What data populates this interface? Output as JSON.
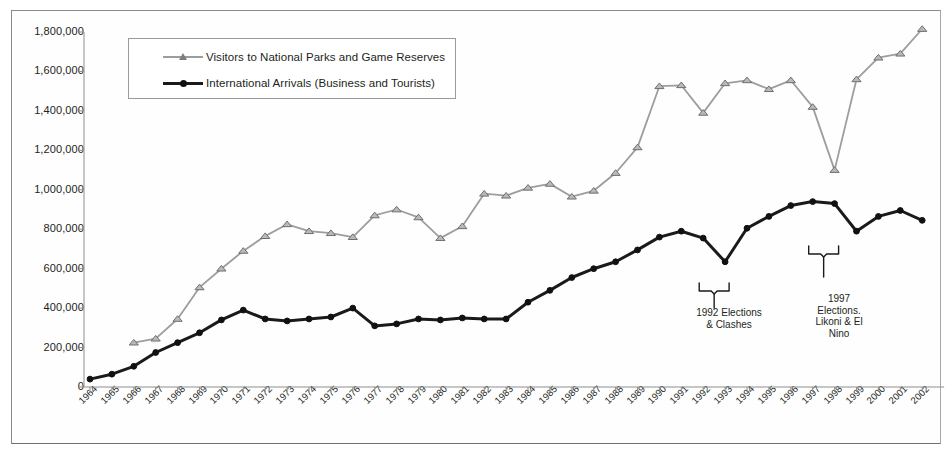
{
  "chart_data": {
    "type": "line",
    "title": "",
    "xlabel": "",
    "ylabel": "",
    "ylim": [
      0,
      1800000
    ],
    "ytick_labels": [
      "1,800,000",
      "1,600,000",
      "1,400,000",
      "1,200,000",
      "1,000,000",
      "800,000",
      "600,000",
      "400,000",
      "200,000",
      "0"
    ],
    "ytick_values": [
      1800000,
      1600000,
      1400000,
      1200000,
      1000000,
      800000,
      600000,
      400000,
      200000,
      0
    ],
    "grid": false,
    "legend_position": "top-left-inside",
    "categories": [
      "1964",
      "1965",
      "1966",
      "1967",
      "1968",
      "1969",
      "1970",
      "1971",
      "1972",
      "1973",
      "1974",
      "1975",
      "1976",
      "1977",
      "1978",
      "1979",
      "1980",
      "1981",
      "1982",
      "1983",
      "1984",
      "1985",
      "1986",
      "1987",
      "1988",
      "1989",
      "1990",
      "1991",
      "1992",
      "1993",
      "1994",
      "1995",
      "1996",
      "1997",
      "1998",
      "1999",
      "2000",
      "2001",
      "2002"
    ],
    "series": [
      {
        "name": "Visitors to National Parks and Game Reserves",
        "color": "#9d9d9d",
        "marker": "triangle",
        "values": [
          null,
          null,
          225000,
          245000,
          345000,
          505000,
          600000,
          690000,
          765000,
          825000,
          790000,
          780000,
          760000,
          870000,
          900000,
          860000,
          755000,
          815000,
          980000,
          970000,
          1010000,
          1030000,
          965000,
          995000,
          1085000,
          1215000,
          1525000,
          1530000,
          1390000,
          1540000,
          1555000,
          1510000,
          1555000,
          1420000,
          1100000,
          1560000,
          1670000,
          1690000,
          1815000
        ]
      },
      {
        "name": "International Arrivals (Business and Tourists)",
        "color": "#1a1a1a",
        "marker": "circle",
        "values": [
          40000,
          65000,
          105000,
          175000,
          225000,
          275000,
          340000,
          390000,
          345000,
          335000,
          345000,
          355000,
          400000,
          310000,
          320000,
          345000,
          340000,
          350000,
          345000,
          345000,
          430000,
          490000,
          555000,
          600000,
          635000,
          695000,
          760000,
          790000,
          755000,
          635000,
          805000,
          865000,
          920000,
          940000,
          930000,
          790000,
          865000,
          895000,
          845000
        ]
      }
    ],
    "annotations": [
      {
        "id": "1992",
        "text": "1992 Elections\n& Clashes",
        "bracket_start_year": "1992",
        "bracket_end_year": "1993"
      },
      {
        "id": "1997",
        "text": "1997\nElections.\nLikoni & El\nNino",
        "bracket_start_year": "1997",
        "bracket_end_year": "1998"
      }
    ]
  }
}
